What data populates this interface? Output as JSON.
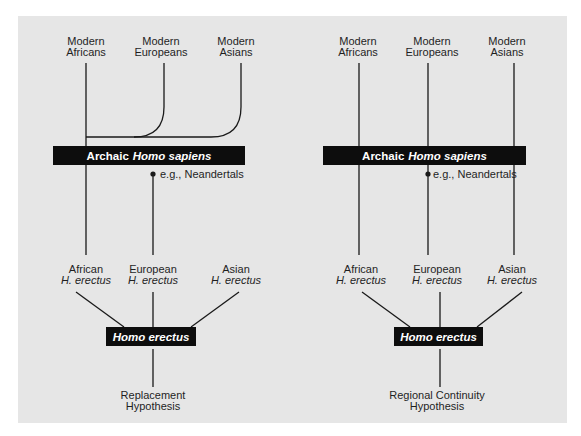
{
  "panels": [
    {
      "id": "replacement",
      "modern_labels": [
        {
          "line1": "Modern",
          "line2": "Africans"
        },
        {
          "line1": "Modern",
          "line2": "Europeans"
        },
        {
          "line1": "Modern",
          "line2": "Asians"
        }
      ],
      "archaic_bar": {
        "prefix": "Archaic",
        "italic": "Homo sapiens"
      },
      "neandertal_note": "e.g., Neandertals",
      "erectus_labels": [
        {
          "line1": "African",
          "line2": "H. erectus"
        },
        {
          "line1": "European",
          "line2": "H. erectus"
        },
        {
          "line1": "Asian",
          "line2": "H. erectus"
        }
      ],
      "erectus_box": "Homo erectus",
      "caption": {
        "line1": "Replacement",
        "line2": "Hypothesis"
      }
    },
    {
      "id": "regional-continuity",
      "modern_labels": [
        {
          "line1": "Modern",
          "line2": "Africans"
        },
        {
          "line1": "Modern",
          "line2": "Europeans"
        },
        {
          "line1": "Modern",
          "line2": "Asians"
        }
      ],
      "archaic_bar": {
        "prefix": "Archaic",
        "italic": "Homo sapiens"
      },
      "neandertal_note": "e.g., Neandertals",
      "erectus_labels": [
        {
          "line1": "African",
          "line2": "H. erectus"
        },
        {
          "line1": "European",
          "line2": "H. erectus"
        },
        {
          "line1": "Asian",
          "line2": "H. erectus"
        }
      ],
      "erectus_box": "Homo erectus",
      "caption": {
        "line1": "Regional Continuity",
        "line2": "Hypothesis"
      }
    }
  ],
  "colors": {
    "panel_bg": "#e6e6e6",
    "line": "#1a1a1a",
    "bar_bg": "#0d0d0d",
    "bar_text": "#ffffff"
  }
}
